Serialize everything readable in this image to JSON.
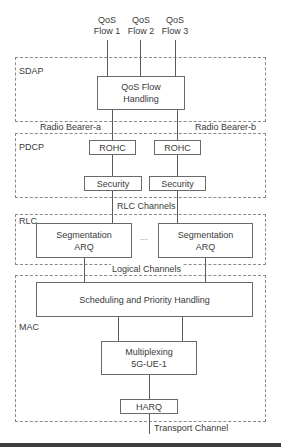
{
  "diagram": {
    "qos_flows": [
      {
        "line1": "QoS",
        "line2": "Flow 1"
      },
      {
        "line1": "QoS",
        "line2": "Flow 2"
      },
      {
        "line1": "QoS",
        "line2": "Flow 3"
      }
    ],
    "layers": {
      "sdap": {
        "label": "SDAP"
      },
      "pdcp": {
        "label": "PDCP"
      },
      "rlc": {
        "label": "RLC"
      },
      "mac": {
        "label": "MAC"
      }
    },
    "sdap_box": {
      "line1": "QoS Flow",
      "line2": "Handling"
    },
    "radio_bearer_a": "Radio Bearer-a",
    "radio_bearer_b": "Radio Bearer-b",
    "rohc_a": "ROHC",
    "rohc_b": "ROHC",
    "security_a": "Security",
    "security_b": "Security",
    "rlc_channels": "RLC Channels",
    "segmentation_a": {
      "line1": "Segmentation",
      "line2": "ARQ"
    },
    "segmentation_b": {
      "line1": "Segmentation",
      "line2": "ARQ"
    },
    "ellipsis": "...",
    "logical_channels": "Logical Channels",
    "scheduling": "Scheduling and Priority Handling",
    "multiplexing": {
      "line1": "Multiplexing",
      "line2": "5G-UE-1"
    },
    "harq": "HARQ",
    "transport_channel": "Transport Channel"
  }
}
